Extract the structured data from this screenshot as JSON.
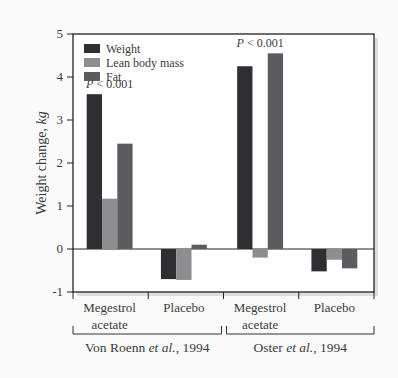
{
  "chart_data": {
    "type": "bar",
    "title": "",
    "xlabel": "",
    "ylabel": "Weight change, kg",
    "ylim": [
      -1,
      5
    ],
    "yticks": [
      -1,
      0,
      1,
      2,
      3,
      4,
      5
    ],
    "grid": false,
    "legend_position": "upper-left inside",
    "categories": [
      "Megestrol acetate",
      "Placebo",
      "Megestrol acetate",
      "Placebo"
    ],
    "category_lines": [
      [
        "Megestrol",
        "acetate"
      ],
      [
        "Placebo"
      ],
      [
        "Megestrol",
        "acetate"
      ],
      [
        "Placebo"
      ]
    ],
    "study_groups": [
      {
        "label_prefix": "Von Roenn ",
        "label_italic": "et al.",
        "label_suffix": ", 1994",
        "categories": [
          0,
          1
        ]
      },
      {
        "label_prefix": "Oster ",
        "label_italic": "et al.",
        "label_suffix": ", 1994",
        "categories": [
          2,
          3
        ]
      }
    ],
    "series": [
      {
        "name": "Weight",
        "color": "#2f2f33",
        "values": [
          3.6,
          -0.7,
          4.25,
          -0.52
        ]
      },
      {
        "name": "Lean body mass",
        "color": "#8e8e90",
        "values": [
          1.17,
          -0.72,
          -0.2,
          -0.25
        ]
      },
      {
        "name": "Fat",
        "color": "#5c5c60",
        "values": [
          2.45,
          0.1,
          4.55,
          -0.45
        ]
      }
    ],
    "annotations": [
      {
        "text_italic": "P",
        "text": " < 0.001",
        "category": 0
      },
      {
        "text_italic": "P",
        "text": " < 0.001",
        "category": 2
      }
    ]
  }
}
